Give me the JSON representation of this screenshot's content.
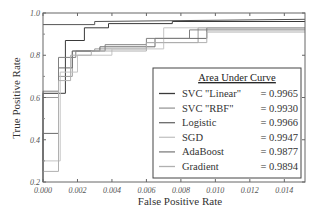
{
  "chart_data": {
    "type": "line",
    "title": "",
    "xlabel": "False Positive Rate",
    "ylabel": "True Positive Rate",
    "xlim": [
      0.0,
      0.0152
    ],
    "ylim": [
      0.2,
      1.0
    ],
    "xticks": [
      "0.000",
      "0.002",
      "0.004",
      "0.006",
      "0.008",
      "0.010",
      "0.012",
      "0.014"
    ],
    "yticks": [
      "0.2",
      "0.4",
      "0.6",
      "0.8",
      "1.0"
    ],
    "grid": false,
    "legend": {
      "title": "Area Under Curve",
      "position": "lower right",
      "entries": [
        {
          "name": "SVC \"Linear\"",
          "value": "= 0.9965"
        },
        {
          "name": "SVC \"RBF\"",
          "value": "= 0.9930"
        },
        {
          "name": "Logistic",
          "value": "= 0.9966"
        },
        {
          "name": "SGD",
          "value": "= 0.9947"
        },
        {
          "name": "AdaBoost",
          "value": "= 0.9877"
        },
        {
          "name": "Gradient",
          "value": "= 0.9894"
        }
      ]
    },
    "series": [
      {
        "name": "SVC \"Linear\"",
        "auc": 0.9965,
        "color": "#3a3a3a",
        "x": [
          0.0,
          0.0,
          0.0013,
          0.0013,
          0.0024,
          0.0024,
          0.0038,
          0.0038,
          0.0075,
          0.0075,
          0.0152
        ],
        "y": [
          0.2,
          0.62,
          0.62,
          0.87,
          0.87,
          0.93,
          0.93,
          0.95,
          0.95,
          0.96,
          0.96
        ]
      },
      {
        "name": "SVC \"RBF\"",
        "auc": 0.993,
        "color": "#9a9a9a",
        "x": [
          0.0,
          0.0,
          0.0009,
          0.0009,
          0.0017,
          0.0017,
          0.003,
          0.003,
          0.006,
          0.006,
          0.009,
          0.009,
          0.0152
        ],
        "y": [
          0.2,
          0.6,
          0.6,
          0.7,
          0.7,
          0.82,
          0.82,
          0.83,
          0.83,
          0.86,
          0.86,
          0.93,
          0.93
        ]
      },
      {
        "name": "Logistic",
        "auc": 0.9966,
        "color": "#6a6a6a",
        "x": [
          0.0,
          0.0,
          0.0009,
          0.0009,
          0.0017,
          0.0017,
          0.0033,
          0.0033,
          0.0065,
          0.0065,
          0.0095,
          0.0095,
          0.0152
        ],
        "y": [
          0.2,
          0.43,
          0.43,
          0.74,
          0.74,
          0.82,
          0.82,
          0.84,
          0.84,
          0.88,
          0.88,
          0.93,
          0.93
        ]
      },
      {
        "name": "SGD",
        "auc": 0.9947,
        "color": "#c4c4c4",
        "x": [
          0.0,
          0.0,
          0.001,
          0.001,
          0.002,
          0.002,
          0.004,
          0.004,
          0.007,
          0.007,
          0.0152
        ],
        "y": [
          0.2,
          0.3,
          0.3,
          0.72,
          0.72,
          0.8,
          0.8,
          0.83,
          0.83,
          0.93,
          0.93
        ]
      },
      {
        "name": "AdaBoost",
        "auc": 0.9877,
        "color": "#808080",
        "x": [
          0.0,
          0.0,
          0.0009,
          0.0009,
          0.0019,
          0.0019,
          0.0036,
          0.0036,
          0.006,
          0.006,
          0.0085,
          0.0085,
          0.0152
        ],
        "y": [
          0.2,
          0.63,
          0.63,
          0.79,
          0.79,
          0.82,
          0.82,
          0.85,
          0.85,
          0.88,
          0.88,
          0.92,
          0.92
        ]
      },
      {
        "name": "Gradient",
        "auc": 0.9894,
        "color": "#b0b0b0",
        "x": [
          0.0,
          0.0,
          0.0009,
          0.0009,
          0.0016,
          0.0016,
          0.0028,
          0.0028,
          0.006,
          0.006,
          0.0095,
          0.0095,
          0.0152
        ],
        "y": [
          0.2,
          0.25,
          0.25,
          0.68,
          0.68,
          0.8,
          0.8,
          0.82,
          0.82,
          0.86,
          0.86,
          0.91,
          0.91
        ]
      },
      {
        "name": "top-ref",
        "auc": null,
        "color": "#555555",
        "x": [
          0.0,
          0.003,
          0.003,
          0.0152
        ],
        "y": [
          0.945,
          0.945,
          0.96,
          0.97
        ]
      }
    ]
  }
}
